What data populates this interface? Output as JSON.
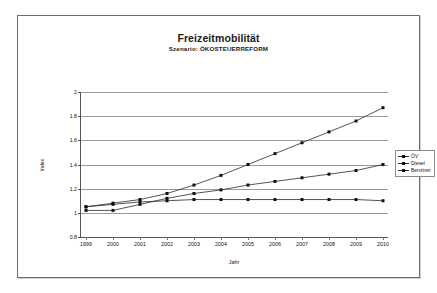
{
  "document": {
    "frame_visible": true
  },
  "chart_data": {
    "type": "line",
    "title": "Freizeitmobilität",
    "subtitle": "Szenario: ÖKOSTEUERREFORM",
    "xlabel": "Jahr",
    "ylabel": "Index",
    "x": [
      1999,
      2000,
      2001,
      2002,
      2003,
      2004,
      2005,
      2006,
      2007,
      2008,
      2009,
      2010
    ],
    "categories": [
      "1999",
      "2000",
      "2001",
      "2002",
      "2003",
      "2004",
      "2005",
      "2006",
      "2007",
      "2008",
      "2009",
      "2010"
    ],
    "ylim": [
      0.8,
      2.0
    ],
    "yticks": [
      0.8,
      1.0,
      1.2,
      1.4,
      1.6,
      1.8,
      2.0
    ],
    "ytick_labels": [
      "0.8",
      "1",
      "1.2",
      "1.4",
      "1.6",
      "1.8",
      "2"
    ],
    "grid": true,
    "legend_position": "right",
    "marker": "square",
    "line_color": "#2a2a2a",
    "marker_color": "#111111",
    "series": [
      {
        "name": "ÖV",
        "values": [
          1.05,
          1.08,
          1.11,
          1.16,
          1.23,
          1.31,
          1.4,
          1.49,
          1.58,
          1.67,
          1.76,
          1.87
        ]
      },
      {
        "name": "Diesel",
        "values": [
          1.02,
          1.02,
          1.07,
          1.12,
          1.16,
          1.19,
          1.23,
          1.26,
          1.29,
          1.32,
          1.35,
          1.4
        ]
      },
      {
        "name": "Benziner",
        "values": [
          1.05,
          1.07,
          1.09,
          1.1,
          1.11,
          1.11,
          1.11,
          1.11,
          1.11,
          1.11,
          1.11,
          1.1
        ]
      }
    ]
  }
}
